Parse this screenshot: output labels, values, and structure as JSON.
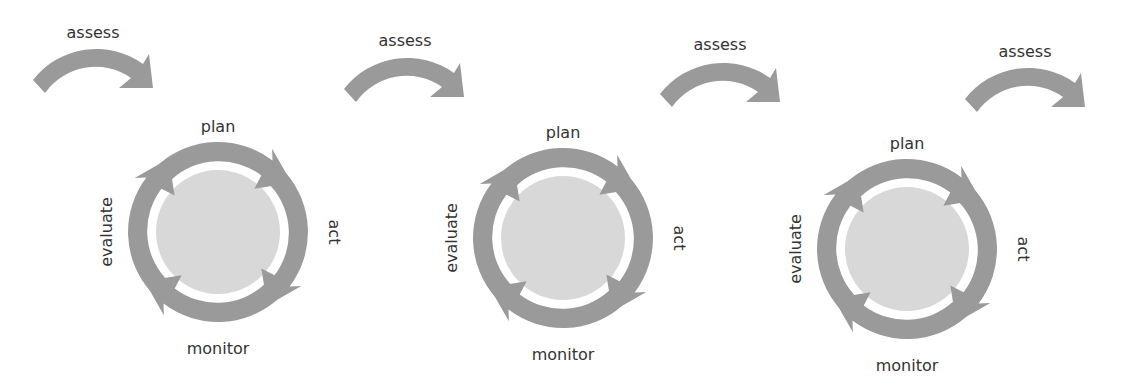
{
  "diagram": {
    "title": "",
    "colors": {
      "arrow": "#9a9a9a",
      "hub": "#d8d8d8",
      "text": "#333333"
    },
    "assess": [
      {
        "label": "assess",
        "cx": 95,
        "cy": 110,
        "lx": 93,
        "ly": 38
      },
      {
        "label": "assess",
        "cx": 406,
        "cy": 120,
        "lx": 405,
        "ly": 46
      },
      {
        "label": "assess",
        "cx": 722,
        "cy": 127,
        "lx": 720,
        "ly": 50
      },
      {
        "label": "assess",
        "cx": 1027,
        "cy": 133,
        "lx": 1025,
        "ly": 57
      }
    ],
    "cycles": [
      {
        "cx": 218,
        "cy": 232,
        "labels": {
          "plan": "plan",
          "act": "act",
          "monitor": "monitor",
          "evaluate": "evaluate"
        }
      },
      {
        "cx": 563,
        "cy": 238,
        "labels": {
          "plan": "plan",
          "act": "act",
          "monitor": "monitor",
          "evaluate": "evaluate"
        }
      },
      {
        "cx": 907,
        "cy": 249,
        "labels": {
          "plan": "plan",
          "act": "act",
          "monitor": "monitor",
          "evaluate": "evaluate"
        }
      }
    ]
  }
}
